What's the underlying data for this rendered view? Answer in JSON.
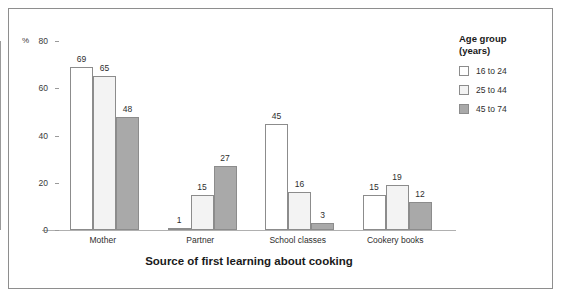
{
  "chart_data": {
    "type": "bar",
    "title": "",
    "xlabel": "Source of first learning about cooking",
    "ylabel": "%",
    "ylim": [
      0,
      80
    ],
    "yticks": [
      0,
      20,
      40,
      60,
      80
    ],
    "grid": false,
    "legend_position": "right",
    "legend_title": "Age group\n(years)",
    "categories": [
      "Mother",
      "Partner",
      "School classes",
      "Cookery books"
    ],
    "series": [
      {
        "name": "16 to 24",
        "color": "#ffffff",
        "values": [
          69,
          1,
          45,
          15
        ]
      },
      {
        "name": "25 to 44",
        "color": "#f3f3f3",
        "values": [
          65,
          15,
          16,
          19
        ]
      },
      {
        "name": "45 to 74",
        "color": "#a9a9a9",
        "values": [
          48,
          27,
          3,
          12
        ]
      }
    ]
  },
  "axis": {
    "y_unit": "%",
    "y_tick_labels": [
      "0",
      "20",
      "40",
      "60",
      "80"
    ],
    "x_title": "Source of first learning about cooking",
    "x_tick_labels": [
      "Mother",
      "Partner",
      "School classes",
      "Cookery books"
    ]
  },
  "legend": {
    "title": "Age group\n(years)",
    "items": [
      {
        "label": "16 to 24",
        "swatch": "white-square-icon"
      },
      {
        "label": "25 to 44",
        "swatch": "light-gray-square-icon"
      },
      {
        "label": "45 to 74",
        "swatch": "dark-gray-square-icon"
      }
    ]
  },
  "bar_labels": {
    "mother": [
      "69",
      "65",
      "48"
    ],
    "partner": [
      "1",
      "15",
      "27"
    ],
    "school_classes": [
      "45",
      "16",
      "3"
    ],
    "cookery_books": [
      "15",
      "19",
      "12"
    ]
  }
}
